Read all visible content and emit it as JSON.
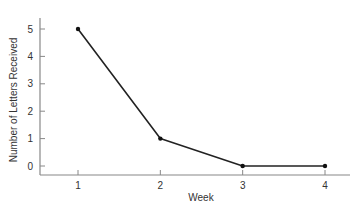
{
  "chart_data": {
    "type": "line",
    "title": "",
    "xlabel": "Week",
    "ylabel": "Number of Letters Received",
    "categories": [
      "1",
      "2",
      "3",
      "4"
    ],
    "x": [
      1,
      2,
      3,
      4
    ],
    "values": [
      5,
      1,
      0,
      0
    ],
    "series": [
      {
        "name": "Letters Received",
        "values": [
          5,
          1,
          0,
          0
        ]
      }
    ],
    "yticks": [
      0,
      1,
      2,
      3,
      4,
      5
    ],
    "xticks": [
      1,
      2,
      3,
      4
    ],
    "ylim": [
      -0.3,
      5.5
    ],
    "xlim": [
      0.5,
      4.3
    ],
    "grid": false,
    "legend": "none",
    "colors": {
      "line": "#222222",
      "axis": "#888888",
      "marker": "#111111"
    }
  }
}
